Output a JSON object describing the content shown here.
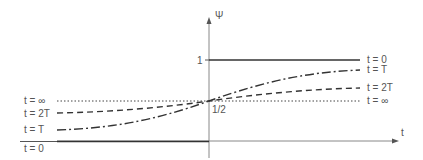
{
  "diagram": {
    "axes": {
      "y_label": "Ψ",
      "x_label": "t",
      "y_tick_one": "1",
      "midpoint_label": "1/2"
    },
    "left_labels": [
      {
        "key": "inf",
        "text": "t = ∞"
      },
      {
        "key": "2T",
        "text": "t = 2T"
      },
      {
        "key": "T",
        "text": "t = T"
      },
      {
        "key": "0",
        "text": "t = 0"
      }
    ],
    "right_labels": [
      {
        "key": "0",
        "text": "t = 0"
      },
      {
        "key": "T",
        "text": "t = T"
      },
      {
        "key": "2T",
        "text": "t = 2T"
      },
      {
        "key": "inf",
        "text": "t = ∞"
      }
    ],
    "curves": [
      {
        "name": "t = 0",
        "style": "solid",
        "description": "step function: 0 for x<0, 1 for x>0"
      },
      {
        "name": "t = T",
        "style": "dash-dot",
        "description": "sigmoid through 1/2 at origin"
      },
      {
        "name": "t = 2T",
        "style": "dashed",
        "description": "flatter sigmoid through 1/2"
      },
      {
        "name": "t = ∞",
        "style": "dotted",
        "description": "constant at 1/2"
      }
    ],
    "colors": {
      "line": "#333333",
      "axis": "#777777",
      "text": "#555555"
    }
  }
}
